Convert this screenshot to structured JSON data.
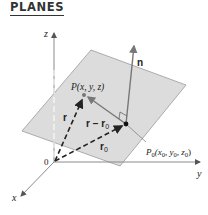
{
  "heading": "PLANES",
  "diagram": {
    "axes": {
      "x_label": "x",
      "y_label": "y",
      "z_label": "z",
      "origin_label": "0"
    },
    "points": {
      "P_label": "P(x, y, z)",
      "P0_label_main": "P",
      "P0_label_sub": "0",
      "P0_label_coords": "(x",
      "P0_coord_x_sub": "0",
      "P0_coord_y": ", y",
      "P0_coord_y_sub": "0",
      "P0_coord_z": ", z",
      "P0_coord_z_sub": "0",
      "P0_close": ")"
    },
    "vectors": {
      "normal_label": "n",
      "r_label": "r",
      "r_minus_r0_label": "r − r",
      "r_minus_r0_sub": "0",
      "r0_label": "r",
      "r0_sub": "0"
    },
    "colors": {
      "plane_fill": "#dcdcdc",
      "plane_edge": "#9a9a9a",
      "axis": "#8a8a8a",
      "vector": "#222222",
      "normal": "#777777"
    }
  }
}
